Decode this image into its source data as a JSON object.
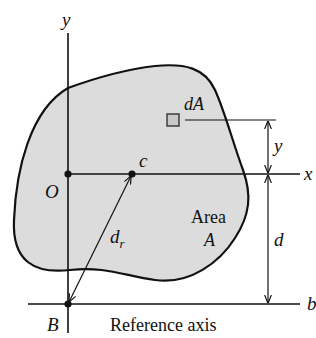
{
  "diagram": {
    "colors": {
      "area_fill": "#dcdcdc",
      "stroke": "#111111",
      "element_fill": "#c8c8c8",
      "background": "#ffffff"
    },
    "axes": {
      "y_label": "y",
      "x_label": "x",
      "b_label": "b"
    },
    "points": {
      "origin_label": "O",
      "centroid_label": "c",
      "reference_point_label": "B"
    },
    "element": {
      "label": "dA"
    },
    "dimensions": {
      "y_label": "y",
      "d_label": "d",
      "dr_label_main": "d",
      "dr_label_sub": "r"
    },
    "area": {
      "line1": "Area",
      "line2": "A"
    },
    "reference_axis_label": "Reference axis"
  }
}
